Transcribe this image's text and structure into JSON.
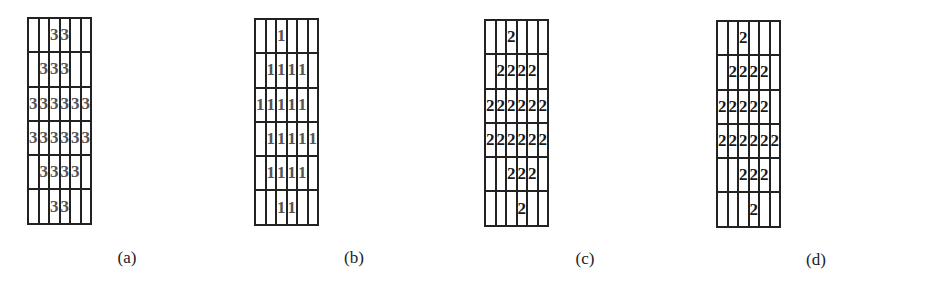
{
  "panels": [
    {
      "id": "a",
      "caption": "(a)",
      "style": "light",
      "grid": [
        [
          "",
          "",
          "3",
          "3",
          "",
          ""
        ],
        [
          "",
          "3",
          "3",
          "3",
          "",
          ""
        ],
        [
          "3",
          "3",
          "3",
          "3",
          "3",
          "3"
        ],
        [
          "3",
          "3",
          "3",
          "3",
          "3",
          "3"
        ],
        [
          "",
          "3",
          "3",
          "3",
          "3",
          ""
        ],
        [
          "",
          "",
          "3",
          "3",
          "",
          ""
        ]
      ]
    },
    {
      "id": "b",
      "caption": "(b)",
      "style": "light",
      "grid": [
        [
          "",
          "",
          "1",
          "",
          "",
          ""
        ],
        [
          "",
          "1",
          "1",
          "1",
          "1",
          ""
        ],
        [
          "1",
          "1",
          "1",
          "1",
          "1",
          ""
        ],
        [
          "",
          "1",
          "1",
          "1",
          "1",
          "1"
        ],
        [
          "",
          "1",
          "1",
          "1",
          "1",
          ""
        ],
        [
          "",
          "",
          "1",
          "1",
          "",
          ""
        ]
      ]
    },
    {
      "id": "c",
      "caption": "(c)",
      "style": "dark",
      "grid": [
        [
          "",
          "",
          "2",
          "",
          "",
          ""
        ],
        [
          "",
          "2",
          "2",
          "2",
          "2",
          ""
        ],
        [
          "2",
          "2",
          "2",
          "2",
          "2",
          "2"
        ],
        [
          "2",
          "2",
          "2",
          "2",
          "2",
          "2"
        ],
        [
          "",
          "",
          "2",
          "2",
          "2",
          ""
        ],
        [
          "",
          "",
          "",
          "2",
          "",
          ""
        ]
      ]
    },
    {
      "id": "d",
      "caption": "(d)",
      "style": "dark",
      "grid": [
        [
          "",
          "",
          "2",
          "",
          "",
          ""
        ],
        [
          "",
          "2",
          "2",
          "2",
          "2",
          ""
        ],
        [
          "2",
          "2",
          "2",
          "2",
          "2",
          ""
        ],
        [
          "2",
          "2",
          "2",
          "2",
          "2",
          "2"
        ],
        [
          "",
          "",
          "2",
          "2",
          "2",
          ""
        ],
        [
          "",
          "",
          "",
          "2",
          "",
          ""
        ]
      ]
    }
  ]
}
